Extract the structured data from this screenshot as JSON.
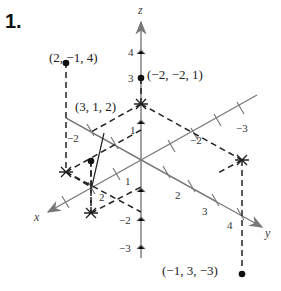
{
  "problem_number": "1.",
  "axes": {
    "x_label": "x",
    "y_label": "y",
    "z_label": "z",
    "z_ticks": [
      "4",
      "3",
      "1",
      "−2",
      "−3"
    ],
    "x_ticks": [
      "1",
      "2",
      "−2"
    ],
    "y_ticks": [
      "2",
      "3",
      "4",
      "−2",
      "−3"
    ]
  },
  "points": [
    {
      "label": "(2, −1, 4)"
    },
    {
      "label": "(−2, −2, 1)"
    },
    {
      "label": "(3, 1, 2)"
    },
    {
      "label": "(−1, 3, −3)"
    }
  ],
  "colors": {
    "axis": "#7a7a7a",
    "dash": "#222222",
    "point": "#111111"
  }
}
